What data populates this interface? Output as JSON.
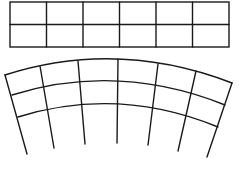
{
  "diagram": {
    "type": "grid-warp",
    "stroke_color": "#1a1a1a",
    "background": "#ffffff",
    "rect_grid": {
      "columns": 6,
      "rows": 2,
      "x": 10,
      "y": 2,
      "width": 219,
      "height": 45
    },
    "arc_grid": {
      "radial_lines": 7,
      "arcs": 3,
      "arc_rows": [
        {
          "left": [
            5,
            75
          ],
          "mid": [
            118,
            59
          ],
          "right": [
            232,
            83
          ]
        },
        {
          "left": [
            12,
            95
          ],
          "mid": [
            118,
            81
          ],
          "right": [
            225,
            105
          ]
        },
        {
          "left": [
            18,
            117
          ],
          "mid": [
            118,
            104
          ],
          "right": [
            218,
            127
          ]
        }
      ],
      "radials": [
        {
          "top": [
            5,
            75
          ],
          "bottom": [
            27,
            154
          ]
        },
        {
          "top": [
            40,
            66
          ],
          "bottom": [
            54,
            148
          ]
        },
        {
          "top": [
            78,
            61
          ],
          "bottom": [
            85,
            144
          ]
        },
        {
          "top": [
            118,
            59
          ],
          "bottom": [
            117,
            143
          ]
        },
        {
          "top": [
            158,
            64
          ],
          "bottom": [
            148,
            145
          ]
        },
        {
          "top": [
            196,
            71
          ],
          "bottom": [
            178,
            151
          ]
        },
        {
          "top": [
            232,
            83
          ],
          "bottom": [
            207,
            157
          ]
        }
      ]
    }
  }
}
